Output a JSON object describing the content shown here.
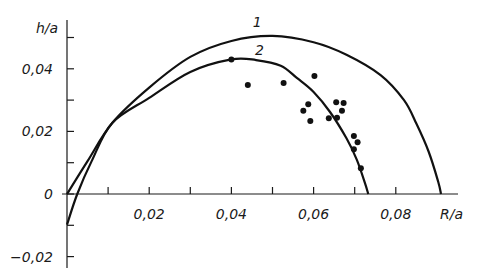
{
  "chart_data": {
    "type": "scatter",
    "title": "",
    "xlabel": "R/a",
    "ylabel": "h/a",
    "xlim": [
      0,
      0.093
    ],
    "ylim": [
      -0.024,
      0.056
    ],
    "grid": false,
    "legend": "curve labels placed inline",
    "x_ticks": [
      0.01,
      0.02,
      0.03,
      0.04,
      0.05,
      0.06,
      0.07,
      0.08
    ],
    "x_tick_labels": [
      {
        "value": 0.02,
        "text": "0,02"
      },
      {
        "value": 0.04,
        "text": "0,04"
      },
      {
        "value": 0.06,
        "text": "0,06"
      },
      {
        "value": 0.08,
        "text": "0,08"
      }
    ],
    "y_ticks": [
      -0.02,
      -0.01,
      0,
      0.01,
      0.02,
      0.03,
      0.04,
      0.05
    ],
    "y_tick_labels": [
      {
        "value": 0.04,
        "text": "0,04"
      },
      {
        "value": 0.02,
        "text": "0,02"
      },
      {
        "value": 0,
        "text": "0"
      },
      {
        "value": -0.02,
        "text": "−0,02"
      }
    ],
    "series": [
      {
        "name": "1",
        "kind": "line",
        "label_pos": [
          0.0463,
          0.0535
        ],
        "x": [
          0.0,
          0.005,
          0.011,
          0.02,
          0.03,
          0.04,
          0.05,
          0.06,
          0.068,
          0.0763,
          0.082,
          0.085,
          0.088,
          0.0903,
          0.091
        ],
        "y": [
          0.0,
          0.0105,
          0.0227,
          0.034,
          0.0438,
          0.0489,
          0.0505,
          0.0485,
          0.0445,
          0.038,
          0.03,
          0.0225,
          0.0135,
          0.004,
          0.0
        ]
      },
      {
        "name": "2",
        "kind": "line",
        "label_pos": [
          0.0468,
          0.0445
        ],
        "x": [
          0.0,
          0.0025,
          0.006,
          0.011,
          0.02,
          0.03,
          0.04,
          0.046,
          0.052,
          0.056,
          0.06,
          0.064,
          0.068,
          0.0705,
          0.0725,
          0.0733
        ],
        "y": [
          -0.0098,
          0.0,
          0.0105,
          0.0227,
          0.0307,
          0.039,
          0.043,
          0.0428,
          0.041,
          0.037,
          0.0326,
          0.0262,
          0.0178,
          0.011,
          0.0035,
          0.0
        ]
      },
      {
        "name": "experiment",
        "kind": "scatter",
        "x": [
          0.04,
          0.044,
          0.0527,
          0.0602,
          0.0587,
          0.0575,
          0.0592,
          0.0655,
          0.0673,
          0.0669,
          0.0637,
          0.0657,
          0.0698,
          0.0707,
          0.0698,
          0.0715
        ],
        "y": [
          0.043,
          0.0348,
          0.0355,
          0.0377,
          0.0287,
          0.0266,
          0.0233,
          0.0293,
          0.0291,
          0.0266,
          0.0242,
          0.0244,
          0.0185,
          0.0165,
          0.0143,
          0.0082
        ]
      }
    ]
  }
}
